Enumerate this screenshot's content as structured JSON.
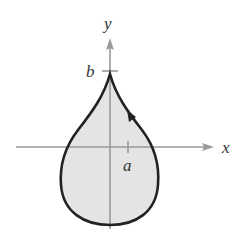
{
  "diagram": {
    "axes": {
      "x_label": "x",
      "y_label": "y",
      "color": "#9a9a9a"
    },
    "ticks": {
      "a_label": "a",
      "b_label": "b"
    },
    "curve": {
      "shape": "teardrop",
      "stroke": "#222222",
      "fill": "#e4e4e4",
      "orientation_arrow": "counterclockwise (arrow on right side pointing up-left)"
    }
  }
}
